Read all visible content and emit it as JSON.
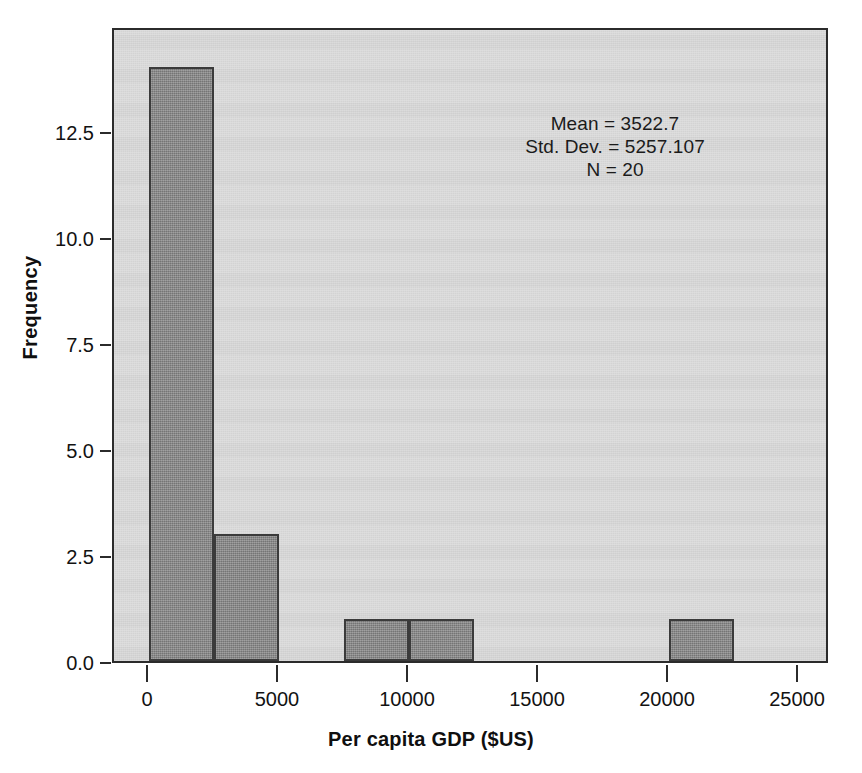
{
  "chart_data": {
    "type": "bar",
    "title": "",
    "subtitle": "",
    "xlabel": "Per capita GDP ($US)",
    "ylabel": "Frequency",
    "xlim": [
      -1000,
      26500
    ],
    "ylim": [
      0,
      14.5
    ],
    "grid": false,
    "legend_position": "none",
    "bin_width": 2500,
    "x_ticks": [
      0,
      5000,
      10000,
      15000,
      20000,
      25000
    ],
    "x_tick_labels": [
      "0",
      "5000",
      "10000",
      "15000",
      "20000",
      "25000"
    ],
    "y_ticks": [
      0.0,
      2.5,
      5.0,
      7.5,
      10.0,
      12.5
    ],
    "y_tick_labels": [
      "0.0",
      "2.5",
      "5.0",
      "7.5",
      "10.0",
      "12.5"
    ],
    "bins": [
      {
        "x_start": 0,
        "x_end": 2500,
        "frequency": 14
      },
      {
        "x_start": 2500,
        "x_end": 5000,
        "frequency": 3
      },
      {
        "x_start": 5000,
        "x_end": 7500,
        "frequency": 0
      },
      {
        "x_start": 7500,
        "x_end": 10000,
        "frequency": 1
      },
      {
        "x_start": 10000,
        "x_end": 12500,
        "frequency": 1
      },
      {
        "x_start": 12500,
        "x_end": 15000,
        "frequency": 0
      },
      {
        "x_start": 15000,
        "x_end": 17500,
        "frequency": 0
      },
      {
        "x_start": 17500,
        "x_end": 20000,
        "frequency": 0
      },
      {
        "x_start": 20000,
        "x_end": 22500,
        "frequency": 1
      },
      {
        "x_start": 22500,
        "x_end": 25000,
        "frequency": 0
      }
    ],
    "categories": [
      "0-2500",
      "2500-5000",
      "5000-7500",
      "7500-10000",
      "10000-12500",
      "12500-15000",
      "15000-17500",
      "17500-20000",
      "20000-22500",
      "22500-25000"
    ],
    "values": [
      14,
      3,
      0,
      1,
      1,
      0,
      0,
      0,
      1,
      0
    ],
    "annotations": {
      "mean_line": "Mean = 3522.7",
      "std_dev_line": "Std. Dev. = 5257.107",
      "n_line": "N = 20"
    },
    "statistics": {
      "mean": 3522.7,
      "std_dev": 5257.107,
      "n": 20
    },
    "colors": {
      "bar_fill": "#868686",
      "bar_edge": "#3b3b3b",
      "panel_background": "#d8d8d8",
      "figure_background": "#ffffff",
      "axis": "#2b2b2b",
      "text": "#121212"
    }
  }
}
